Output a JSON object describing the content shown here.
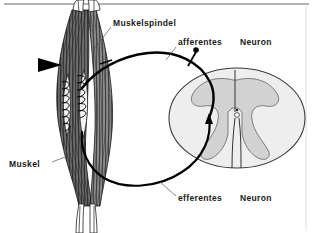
{
  "figure": {
    "language": "de",
    "background_color": "#ffffff",
    "top_rule_color": "#9a9a9a",
    "right_rule_color": "#d8d8d8"
  },
  "labels": {
    "muskelspindel": "Muskelspindel",
    "afferentes": "afferentes",
    "afferentes_neuron": "Neuron",
    "muskel": "Muskel",
    "efferentes": "efferentes",
    "efferentes_neuron": "Neuron"
  },
  "structures": {
    "muscle": {
      "name": "Muskel",
      "fill_color": "#6b6b6b",
      "outline_color": "#1a1a1a",
      "description": "spindelfoermiger Skelettmuskel mit gestreiften Faserbuendeln und Sehnenenden"
    },
    "muscle_spindle": {
      "name": "Muskelspindel",
      "fill_color": "#f2f2f2",
      "outline_color": "#111111",
      "description": "intrafusale Fasern mit spiralig gewundenen anulospiralen Nervenendigungen"
    },
    "spinal_cord": {
      "name": "Rueckenmark-Querschnitt",
      "white_matter_color": "#eeeeee",
      "gray_matter_color": "#d2d2d2",
      "outline_color": "#333333",
      "description": "ovaler Querschnitt mit schmetterlingsfoermiger grauer Substanz und Zentralkanal"
    },
    "reflex_loop": {
      "name": "Reflexbogen",
      "stroke_color": "#000000",
      "description": "geschlossene Schleife von der Muskelspindel zum Rueckenmark und zurueck"
    },
    "stretch_arrow": {
      "name": "Dehnungsreiz",
      "color": "#000000",
      "description": "schwarze Pfeilspitze links am Muskel"
    },
    "afferent_terminal": {
      "name": "afferente Endigung",
      "color": "#000000",
      "description": "kleiner gefuellter Endknopf am afferenten Schenkel"
    },
    "efferent_arrowhead": {
      "name": "efferenter Pfeil",
      "color": "#000000",
      "description": "Pfeilspitze in die graue Substanz des Rueckenmarks"
    }
  }
}
